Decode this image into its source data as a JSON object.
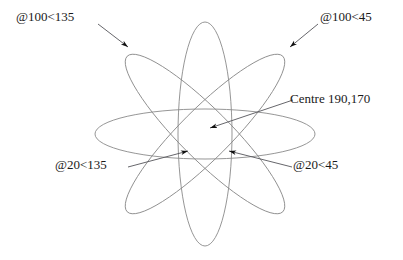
{
  "diagram": {
    "type": "cad-ellipse-annotation",
    "colors": {
      "ellipse_stroke": "#8a8a8a",
      "leader_stroke": "#55555a",
      "arrow_fill": "#111111",
      "text": "#1a1a1a",
      "background": "#ffffff"
    },
    "centre_point": {
      "x": 190,
      "y": 170
    },
    "labels": {
      "top_left": "@100<135",
      "top_right": "@100<45",
      "centre": "Centre 190,170",
      "bottom_left": "@20<135",
      "bottom_right": "@20<45"
    },
    "ellipses": [
      {
        "name": "ellipse-0deg",
        "rotation_deg": 0,
        "semi_major": 110,
        "semi_minor": 25
      },
      {
        "name": "ellipse-45deg",
        "rotation_deg": -45,
        "semi_major": 110,
        "semi_minor": 25
      },
      {
        "name": "ellipse-90deg",
        "rotation_deg": 90,
        "semi_major": 112,
        "semi_minor": 27
      },
      {
        "name": "ellipse-135deg",
        "rotation_deg": 45,
        "semi_major": 110,
        "semi_minor": 25
      }
    ],
    "leaders": [
      {
        "name": "leader-100-135",
        "label": "@100<135",
        "points": "98,24 128,47"
      },
      {
        "name": "leader-100-45",
        "label": "@100<45",
        "points": "318,24 290,47"
      },
      {
        "name": "leader-centre",
        "label": "Centre 190,170",
        "points": "293,100 210,128"
      },
      {
        "name": "leader-20-135",
        "label": "@20<135",
        "points": "128,167 188,151"
      },
      {
        "name": "leader-20-45",
        "label": "@20<45",
        "points": "292,167 229,151"
      }
    ]
  }
}
